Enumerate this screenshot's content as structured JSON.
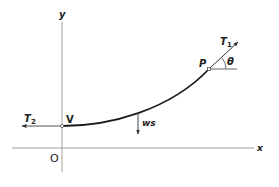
{
  "diagram": {
    "axes": {
      "x_label": "x",
      "y_label": "y",
      "origin_label": "O"
    },
    "points": {
      "vertex_label": "V",
      "point_label": "P"
    },
    "forces": {
      "tension_left_label": "T",
      "tension_left_sub": "2",
      "tension_right_label": "T",
      "tension_right_sub": "1",
      "weight_label": "ws"
    },
    "angle_label": "θ",
    "colors": {
      "axis": "#9a9a9a",
      "curve": "#1a1a1a",
      "text": "#222222"
    }
  }
}
